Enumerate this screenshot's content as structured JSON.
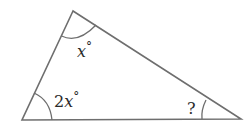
{
  "diagram": {
    "type": "triangle",
    "stroke_color": "#6e6e6e",
    "text_color": "#2b2b2b",
    "vertices": {
      "top": [
        73,
        11
      ],
      "bottom_left": [
        22,
        120
      ],
      "bottom_right": [
        241,
        119
      ]
    },
    "angles": {
      "top": {
        "coef": "",
        "var": "x",
        "unit": "°"
      },
      "bottom_left": {
        "coef": "2",
        "var": "x",
        "unit": "°"
      },
      "bottom_right": {
        "label": "?"
      }
    }
  }
}
